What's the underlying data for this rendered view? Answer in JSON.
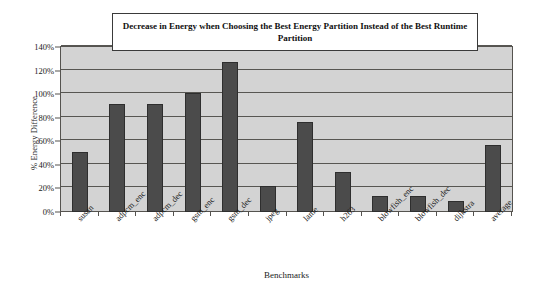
{
  "chart_data": {
    "type": "bar",
    "title": "Decrease in Energy when Choosing the Best Energy Partition Instead of the Best Runtime Partition",
    "xlabel": "Benchmarks",
    "ylabel": "% Energy Difference",
    "categories": [
      "susan",
      "adpcm_enc",
      "adpcm_dec",
      "gsm_enc",
      "gsm_dec",
      "jpeg",
      "lame",
      "h263",
      "blowfish_enc",
      "blowfish_dec",
      "dijkstra",
      "average"
    ],
    "values": [
      51,
      92,
      92,
      101,
      127,
      22,
      76,
      34,
      14,
      14,
      9,
      57
    ],
    "value_unit": "%",
    "ylim": [
      0,
      140
    ],
    "ytick_step": 20,
    "ytick_labels": [
      "0%",
      "20%",
      "40%",
      "60%",
      "80%",
      "100%",
      "120%",
      "140%"
    ],
    "ytick_values": [
      0,
      20,
      40,
      60,
      80,
      100,
      120,
      140
    ],
    "grid": true,
    "legend": "none",
    "series": [
      {
        "name": "% Energy Difference",
        "values": [
          51,
          92,
          92,
          101,
          127,
          22,
          76,
          34,
          14,
          14,
          9,
          57
        ]
      }
    ],
    "colors": {
      "bar_fill": "#4b4b4b",
      "bar_border": "#2e2e2e",
      "plot_background": "#d3d3d3",
      "gridline": "#575652",
      "axis": "#55534f",
      "title_box_background": "#ffffff",
      "title_box_border": "#3a3a3a",
      "page_background": "#ffffff",
      "text": "#1a1a1a"
    }
  }
}
